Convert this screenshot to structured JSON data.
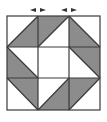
{
  "diagram": {
    "grid": {
      "rows": 3,
      "cols": 3,
      "origin_x": 7,
      "origin_y": 16,
      "cell": 31
    },
    "colors": {
      "shade": "#8c8c8c",
      "line": "#3a3a3a",
      "background": "#ffffff"
    },
    "markers": [
      {
        "name": "left-arrow-marker",
        "x": 38,
        "y": 10
      },
      {
        "name": "right-arrow-marker",
        "x": 69,
        "y": 10
      }
    ],
    "shaded_triangles": [
      {
        "cell": [
          0,
          0
        ],
        "points": "7,47 38,16 38,47"
      },
      {
        "cell": [
          0,
          1
        ],
        "points": "38,16 69,16 38,47"
      },
      {
        "cell": [
          0,
          2
        ],
        "points": "69,16 100,47 69,47"
      },
      {
        "cell": [
          1,
          0
        ],
        "points": "7,47 38,78 7,78"
      },
      {
        "cell": [
          1,
          2
        ],
        "points": "69,47 100,47 100,78"
      },
      {
        "cell": [
          2,
          0
        ],
        "points": "7,78 38,78 38,110"
      },
      {
        "cell": [
          2,
          1
        ],
        "points": "69,78 69,110 38,110"
      },
      {
        "cell": [
          2,
          2
        ],
        "points": "69,78 100,78 69,110"
      }
    ]
  }
}
